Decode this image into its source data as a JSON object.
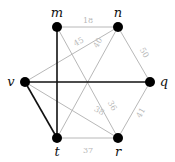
{
  "graph": {
    "nodes": [
      {
        "id": "m",
        "label": "m"
      },
      {
        "id": "n",
        "label": "n"
      },
      {
        "id": "q",
        "label": "q"
      },
      {
        "id": "r",
        "label": "r"
      },
      {
        "id": "t",
        "label": "t"
      },
      {
        "id": "v",
        "label": "v"
      }
    ],
    "edges": [
      {
        "from": "m",
        "to": "n",
        "weight": "18",
        "highlight": false
      },
      {
        "from": "v",
        "to": "n",
        "weight": "45",
        "highlight": false
      },
      {
        "from": "t",
        "to": "n",
        "weight": "40",
        "highlight": false
      },
      {
        "from": "n",
        "to": "q",
        "weight": "50",
        "highlight": false
      },
      {
        "from": "m",
        "to": "r",
        "weight": "36",
        "highlight": false
      },
      {
        "from": "v",
        "to": "r",
        "weight": "38",
        "highlight": false
      },
      {
        "from": "t",
        "to": "r",
        "weight": "37",
        "highlight": false
      },
      {
        "from": "q",
        "to": "r",
        "weight": "41",
        "highlight": false
      },
      {
        "from": "m",
        "to": "t",
        "weight": "",
        "highlight": true
      },
      {
        "from": "v",
        "to": "q",
        "weight": "",
        "highlight": true
      },
      {
        "from": "v",
        "to": "t",
        "weight": "",
        "highlight": true
      }
    ],
    "colors": {
      "highlight_edge": "#111111",
      "normal_edge": "#b8b8b8",
      "node_fill": "#000000"
    }
  }
}
